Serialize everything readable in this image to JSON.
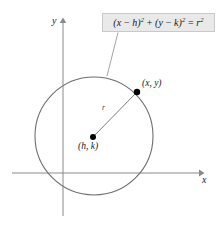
{
  "figure": {
    "kind": "geometry-diagram",
    "background_color": "#ffffff"
  },
  "callout": {
    "equation_plain": "(x - h)^2 + (y - k)^2 = r^2",
    "parts": {
      "open1": "(",
      "var_x": "x",
      "minus1": " − ",
      "var_h": "h",
      "close1": ")",
      "exp1": "2",
      "plus": " + ",
      "open2": "(",
      "var_y": "y",
      "minus2": " − ",
      "var_k": "k",
      "close2": ")",
      "exp2": "2",
      "equals": " = ",
      "var_r": "r",
      "exp3": "2"
    },
    "fill_color": "#e9e9e9",
    "border_color": "#c9c9c9",
    "leader_color": "#9a9a9a"
  },
  "axes": {
    "x_label": "x",
    "y_label": "y",
    "color": "#8a8a8a",
    "x_axis": {
      "x1": 12,
      "y1": 173,
      "x2": 200,
      "y2": 173
    },
    "y_axis": {
      "x1": 63,
      "y1": 22,
      "x2": 63,
      "y2": 216
    }
  },
  "circle": {
    "center_px": {
      "x": 94,
      "y": 136
    },
    "radius_px": 59,
    "stroke_color": "#6e6e6e",
    "stroke_width": 1.1
  },
  "points": [
    {
      "name": "center-point",
      "label": "(h, k)",
      "px": {
        "x": 93,
        "y": 137
      },
      "dot_color": "#000000"
    },
    {
      "name": "circle-point",
      "label": "(x, y)",
      "px": {
        "x": 137,
        "y": 92
      },
      "dot_color": "#000000"
    }
  ],
  "radius_segment": {
    "label": "r",
    "from_px": {
      "x": 93,
      "y": 137
    },
    "to_px": {
      "x": 137,
      "y": 92
    },
    "color": "#6b6b6b"
  }
}
